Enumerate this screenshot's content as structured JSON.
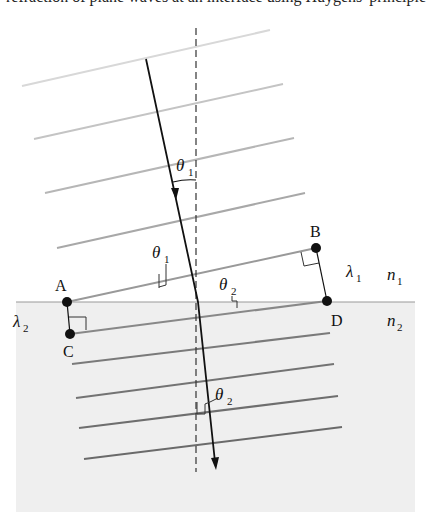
{
  "caption": "refraction of plane waves at an interface using Huygens' principle",
  "labels": {
    "A": "A",
    "B": "B",
    "C": "C",
    "D": "D",
    "theta": "θ",
    "lambda": "λ",
    "n": "n",
    "sub1": "1",
    "sub2": "2"
  },
  "colors": {
    "medium2_fill": "#efefef",
    "interface": "#999999",
    "wavefront_upper_light": "#d0d0d0",
    "wavefront_upper_mid": "#b0b0b0",
    "wavefront_lower": "#777777",
    "ray": "#111111"
  },
  "points": {
    "A": [
      67,
      302
    ],
    "B": [
      316,
      248
    ],
    "C": [
      70,
      334
    ],
    "D": [
      327,
      301
    ]
  }
}
